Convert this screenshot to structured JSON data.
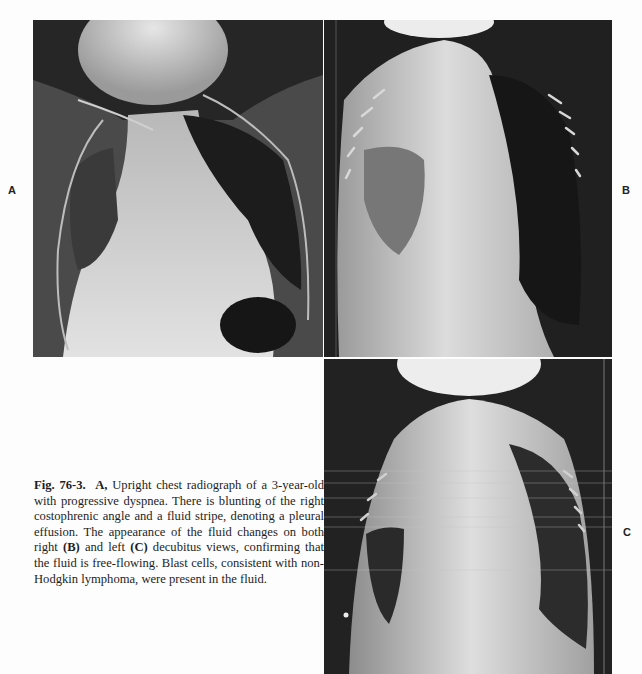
{
  "figure": {
    "number": "Fig. 76-3.",
    "panels": [
      {
        "id": "A",
        "label": "A",
        "description": "Upright chest radiograph"
      },
      {
        "id": "B",
        "label": "B",
        "description": "Right decubitus view"
      },
      {
        "id": "C",
        "label": "C",
        "description": "Left decubitus view"
      }
    ],
    "caption": {
      "lead_label": "A,",
      "part1": " Upright chest radiograph of a 3-year-old with progressive dyspnea. There is blunting of the right costophrenic angle and a fluid stripe, denoting a pleural effusion. The appearance of the fluid changes on both right ",
      "ref_b": "(B)",
      "part2": " and left ",
      "ref_c": "(C)",
      "part3": " decubitus views, confirming that the fluid is free-flowing. Blast cells, consistent with non-Hodgkin lymphoma, were present in the fluid."
    }
  }
}
